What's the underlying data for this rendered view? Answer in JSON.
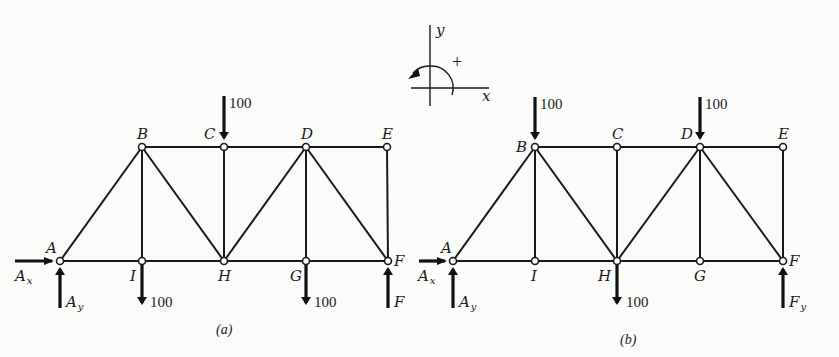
{
  "figure": {
    "sign_convention": {
      "x_label": "x",
      "y_label": "y",
      "moment_sign": "+",
      "moment_direction": "counterclockwise"
    },
    "panels": [
      {
        "caption": "(a)",
        "joints": {
          "A": "A",
          "B": "B",
          "C": "C",
          "D": "D",
          "E": "E",
          "F": "F",
          "G": "G",
          "H": "H",
          "I": "I"
        },
        "loads": [
          {
            "joint": "C",
            "value": "100",
            "direction": "down"
          },
          {
            "joint": "I",
            "value": "100",
            "direction": "down"
          },
          {
            "joint": "G",
            "value": "100",
            "direction": "down"
          }
        ],
        "reactions": {
          "Ax": {
            "main": "A",
            "sub": "x"
          },
          "Ay": {
            "main": "A",
            "sub": "y"
          },
          "F": {
            "main": "F",
            "sub": ""
          }
        },
        "members": [
          "AB",
          "AI",
          "BI",
          "BC",
          "BH",
          "IH",
          "CH",
          "CD",
          "DH",
          "DG",
          "DE",
          "DF",
          "HG",
          "GF",
          "EF"
        ]
      },
      {
        "caption": "(b)",
        "joints": {
          "A": "A",
          "B": "B",
          "C": "C",
          "D": "D",
          "E": "E",
          "F": "F",
          "G": "G",
          "H": "H",
          "I": "I"
        },
        "loads": [
          {
            "joint": "B",
            "value": "100",
            "direction": "down"
          },
          {
            "joint": "D",
            "value": "100",
            "direction": "down"
          },
          {
            "joint": "H",
            "value": "100",
            "direction": "down"
          }
        ],
        "reactions": {
          "Ax": {
            "main": "A",
            "sub": "x"
          },
          "Ay": {
            "main": "A",
            "sub": "y"
          },
          "Fy": {
            "main": "F",
            "sub": "y"
          }
        },
        "members": [
          "AB",
          "AI",
          "BI",
          "BC",
          "BH",
          "IH",
          "CH",
          "CD",
          "DH",
          "DG",
          "DE",
          "DF",
          "HG",
          "GF",
          "EF"
        ]
      }
    ]
  }
}
